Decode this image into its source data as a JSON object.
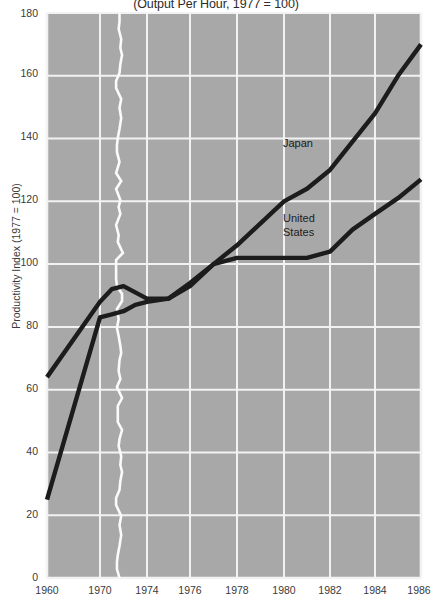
{
  "chart_data": {
    "type": "line",
    "title": "(Output Per Hour, 1977 = 100)",
    "xlabel": "",
    "ylabel": "Productivity Index (1977 = 100)",
    "grid": true,
    "legend_position": "inline-annotations",
    "plot_background": "#a8a8a8",
    "grid_color": "#f2f2f2",
    "line_color": "#1c1c1c",
    "axis_break": {
      "present": true,
      "between": [
        "1970",
        "1974"
      ],
      "style": "torn-white-zigzag"
    },
    "ylim": [
      0,
      180
    ],
    "yticks": [
      0,
      20,
      40,
      60,
      80,
      100,
      120,
      140,
      160,
      180
    ],
    "ytick_labels": [
      "0",
      "20",
      "40",
      "60",
      "80",
      "100",
      "120",
      "140",
      "160",
      "180"
    ],
    "x": [
      1960,
      1970,
      1974,
      1976,
      1978,
      1980,
      1982,
      1984,
      1986
    ],
    "xtick_labels": [
      "1960",
      "1970",
      "1974",
      "1976",
      "1978",
      "1980",
      "1982",
      "1984",
      "1986"
    ],
    "series": [
      {
        "name": "Japan",
        "annotation": "Japan",
        "x": [
          1960,
          1970,
          1971,
          1972,
          1973,
          1974,
          1975,
          1976,
          1977,
          1978,
          1979,
          1980,
          1981,
          1982,
          1983,
          1984,
          1985,
          1986
        ],
        "values": [
          25,
          83,
          84,
          85,
          87,
          88,
          89,
          93,
          100,
          106,
          113,
          120,
          124,
          130,
          139,
          148,
          160,
          170
        ]
      },
      {
        "name": "United States",
        "annotation": "United States",
        "x": [
          1960,
          1970,
          1971,
          1972,
          1973,
          1974,
          1975,
          1976,
          1977,
          1978,
          1979,
          1980,
          1981,
          1982,
          1983,
          1984,
          1985,
          1986
        ],
        "values": [
          64,
          88,
          92,
          93,
          91,
          89,
          89,
          94,
          100,
          102,
          102,
          102,
          102,
          104,
          111,
          116,
          121,
          127
        ]
      }
    ]
  },
  "annotations": {
    "japan": "Japan",
    "united_states_line1": "United",
    "united_states_line2": "States"
  }
}
